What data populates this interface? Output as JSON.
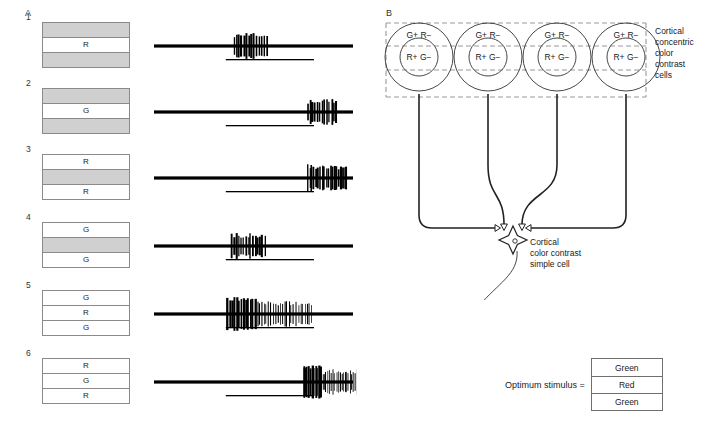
{
  "figure": {
    "panel_a_letter": "A",
    "panel_b_letter": "B"
  },
  "panel_a": {
    "rows": [
      {
        "number": "1",
        "stimulus": {
          "bands": [
            {
              "label": "",
              "shade": "gray"
            },
            {
              "label": "R",
              "shade": "white"
            },
            {
              "label": "",
              "shade": "gray"
            }
          ]
        },
        "response": {
          "type": "on-response",
          "burst_start_frac": 0.4,
          "burst_end_frac": 0.56,
          "density": "brief-burst",
          "spike_count": 14,
          "max_amplitude": 13,
          "bar_start_frac": 0.36,
          "bar_end_frac": 0.79
        }
      },
      {
        "number": "2",
        "stimulus": {
          "bands": [
            {
              "label": "",
              "shade": "gray"
            },
            {
              "label": "G",
              "shade": "white"
            },
            {
              "label": "",
              "shade": "gray"
            }
          ]
        },
        "response": {
          "type": "off-response",
          "burst_start_frac": 0.76,
          "burst_end_frac": 0.9,
          "density": "brief-burst",
          "spike_count": 13,
          "max_amplitude": 13,
          "bar_start_frac": 0.36,
          "bar_end_frac": 0.79
        }
      },
      {
        "number": "3",
        "stimulus": {
          "bands": [
            {
              "label": "R",
              "shade": "white"
            },
            {
              "label": "",
              "shade": "gray"
            },
            {
              "label": "R",
              "shade": "white"
            }
          ]
        },
        "response": {
          "type": "off-response",
          "burst_start_frac": 0.76,
          "burst_end_frac": 0.95,
          "density": "medium-burst",
          "spike_count": 20,
          "max_amplitude": 14,
          "bar_start_frac": 0.36,
          "bar_end_frac": 0.79
        }
      },
      {
        "number": "4",
        "stimulus": {
          "bands": [
            {
              "label": "G",
              "shade": "white"
            },
            {
              "label": "",
              "shade": "gray"
            },
            {
              "label": "G",
              "shade": "white"
            }
          ]
        },
        "response": {
          "type": "on-response",
          "burst_start_frac": 0.39,
          "burst_end_frac": 0.55,
          "density": "brief-burst",
          "spike_count": 15,
          "max_amplitude": 13,
          "bar_start_frac": 0.36,
          "bar_end_frac": 0.79
        }
      },
      {
        "number": "5",
        "stimulus": {
          "bands": [
            {
              "label": "G",
              "shade": "white"
            },
            {
              "label": "R",
              "shade": "white"
            },
            {
              "label": "G",
              "shade": "white"
            }
          ]
        },
        "response": {
          "type": "on-response-sustained",
          "burst_start_frac": 0.37,
          "burst_end_frac": 0.78,
          "density": "sustained",
          "spike_count": 38,
          "max_amplitude": 17,
          "bar_start_frac": 0.36,
          "bar_end_frac": 0.79
        }
      },
      {
        "number": "6",
        "stimulus": {
          "bands": [
            {
              "label": "R",
              "shade": "white"
            },
            {
              "label": "G",
              "shade": "white"
            },
            {
              "label": "R",
              "shade": "white"
            }
          ]
        },
        "response": {
          "type": "off-response-sustained",
          "burst_start_frac": 0.74,
          "burst_end_frac": 1.0,
          "density": "sustained",
          "spike_count": 32,
          "max_amplitude": 17,
          "bar_start_frac": 0.36,
          "bar_end_frac": 0.79
        }
      }
    ]
  },
  "panel_b": {
    "cells": [
      {
        "surround_label": "G+ R−",
        "center_label": "R+ G−"
      },
      {
        "surround_label": "G+ R−",
        "center_label": "R+ G−"
      },
      {
        "surround_label": "G+ R−",
        "center_label": "R+ G−"
      },
      {
        "surround_label": "G+ R−",
        "center_label": "R+ G−"
      }
    ],
    "concentric_caption": "Cortical\nconcentric\ncolor\ncontrast\ncells",
    "concentric_caption_lines": [
      "Cortical",
      "concentric",
      "color",
      "contrast",
      "cells"
    ],
    "simple_cell_caption_lines": [
      "Cortical",
      "color contrast",
      "simple cell"
    ],
    "legend": {
      "text": "Optimum stimulus =",
      "bands": [
        "Green",
        "Red",
        "Green"
      ]
    }
  },
  "colors": {
    "ink": "#1a1a1a",
    "gray_band": "#d0d0d0",
    "box_border": "#8a8a8a",
    "dashed": "#9a9a9a",
    "trace": "#000000"
  }
}
